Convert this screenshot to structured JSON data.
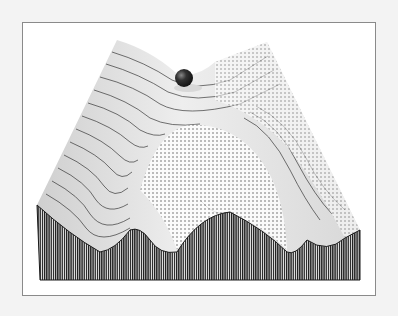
{
  "figure": {
    "title": "Energy landscape with ball resting in saddle",
    "colors": {
      "background": "#f3f3f3",
      "frame_fill": "#ffffff",
      "frame_border": "#8a8a8a",
      "ink": "#1a1a1a",
      "surface_light": "#e8e8e8",
      "ball": "#2a2a2a"
    },
    "ball": {
      "cx": 184,
      "cy": 78,
      "r": 9
    },
    "front_face": {
      "left_x": 37,
      "right_x": 360,
      "bottom_y": 280,
      "profile": [
        [
          37,
          205
        ],
        [
          70,
          235
        ],
        [
          100,
          252
        ],
        [
          130,
          230
        ],
        [
          150,
          240
        ],
        [
          177,
          252
        ],
        [
          205,
          225
        ],
        [
          230,
          212
        ],
        [
          260,
          228
        ],
        [
          287,
          252
        ],
        [
          307,
          240
        ],
        [
          327,
          250
        ],
        [
          345,
          238
        ],
        [
          360,
          230
        ]
      ]
    },
    "surface_outline": [
      [
        37,
        205
      ],
      [
        117,
        40
      ],
      [
        150,
        55
      ],
      [
        175,
        72
      ],
      [
        200,
        68
      ],
      [
        267,
        42
      ],
      [
        360,
        230
      ]
    ]
  }
}
